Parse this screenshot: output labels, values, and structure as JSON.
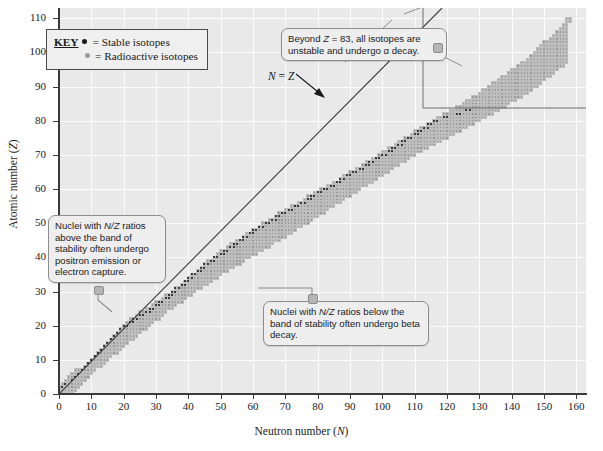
{
  "chart_data": {
    "type": "scatter",
    "title": "",
    "xlabel": "Neutron number (N)",
    "ylabel": "Atomic number (Z)",
    "xlim": [
      0,
      163
    ],
    "ylim": [
      0,
      113
    ],
    "xticks": [
      0,
      10,
      20,
      30,
      40,
      50,
      60,
      70,
      80,
      90,
      100,
      110,
      120,
      130,
      140,
      150,
      160
    ],
    "yticks": [
      0,
      10,
      20,
      30,
      40,
      50,
      60,
      70,
      80,
      90,
      100,
      110
    ],
    "grid": true,
    "legend_position": "top-left",
    "series": [
      {
        "name": "Stable isotopes",
        "marker": "black-dot",
        "color": "#151515"
      },
      {
        "name": "Radioactive isotopes",
        "marker": "gray-square",
        "color": "#9a9a9a"
      }
    ],
    "reference_line": {
      "label": "N = Z",
      "slope": 1,
      "intercept": 0
    },
    "band_of_stability": {
      "description": "Band of known nuclides plotted as N (neutrons) vs Z (protons); stable nuclides lie along the lower edge of the band, curving below N = Z as Z increases.",
      "stable_line_points": [
        [
          0,
          1
        ],
        [
          6,
          6
        ],
        [
          10,
          10
        ],
        [
          20,
          20
        ],
        [
          30,
          26
        ],
        [
          45,
          38
        ],
        [
          60,
          48
        ],
        [
          82,
          60
        ],
        [
          100,
          70
        ],
        [
          116,
          80
        ],
        [
          126,
          83
        ]
      ],
      "band_lower_points": [
        [
          0,
          0
        ],
        [
          8,
          4
        ],
        [
          20,
          14
        ],
        [
          36,
          26
        ],
        [
          52,
          36
        ],
        [
          70,
          46
        ],
        [
          90,
          58
        ],
        [
          110,
          70
        ],
        [
          130,
          80
        ],
        [
          145,
          88
        ],
        [
          157,
          97
        ]
      ],
      "band_upper_points": [
        [
          2,
          2
        ],
        [
          10,
          10
        ],
        [
          22,
          22
        ],
        [
          35,
          30
        ],
        [
          50,
          42
        ],
        [
          70,
          54
        ],
        [
          92,
          66
        ],
        [
          112,
          78
        ],
        [
          130,
          88
        ],
        [
          146,
          99
        ],
        [
          157,
          109
        ]
      ]
    },
    "annotations": [
      {
        "id": "key",
        "title": "KEY",
        "rows": [
          {
            "marker": "black-dot",
            "eq": "=",
            "label": "Stable isotopes"
          },
          {
            "marker": "gray-dot",
            "eq": "=",
            "label": "Radioactive isotopes"
          }
        ]
      },
      {
        "id": "beyond-z83",
        "text_a": "Beyond ",
        "text_b": "Z",
        "text_c": " = 83, all isotopes are unstable and undergo α decay."
      },
      {
        "id": "above-band",
        "text_a": "Nuclei with ",
        "text_b": "N/Z",
        "text_c": " ratios above the band of stability often undergo positron emission or electron capture."
      },
      {
        "id": "below-band",
        "text_a": "Nuclei with ",
        "text_b": "N/Z",
        "text_c": " ratios below the band of stability often undergo beta decay."
      }
    ]
  },
  "axes": {
    "x_title_main": "Neutron number (",
    "x_title_var": "N",
    "x_title_end": ")",
    "y_title_main": "Atomic number (",
    "y_title_var": "Z",
    "y_title_end": ")"
  },
  "key": {
    "word": "KEY",
    "stable_eq": "=",
    "stable_label": "Stable isotopes",
    "radio_eq": "=",
    "radio_label": "Radioactive isotopes"
  },
  "nz_line_label": {
    "var_n": "N",
    "eq": " = ",
    "var_z": "Z"
  },
  "callouts": {
    "beyond": {
      "pre": "Beyond ",
      "var": "Z",
      "post": " = 83, all isotopes are unstable and undergo α decay."
    },
    "above": {
      "pre": "Nuclei with ",
      "var": "N/Z",
      "post": " ratios above the band of stability often undergo positron emission or electron capture."
    },
    "below": {
      "pre": "Nuclei with ",
      "var": "N/Z",
      "post": " ratios below the band of stability often undergo beta decay."
    }
  },
  "colors": {
    "plot_bg": "#e9e9e9",
    "grid": "#fbfbfb",
    "cell": "#9a9a9a",
    "stable_dot": "#151515",
    "axis": "#3a3a3a",
    "callout_bg": "#eeeeee",
    "callout_border": "#8d8d8d"
  }
}
